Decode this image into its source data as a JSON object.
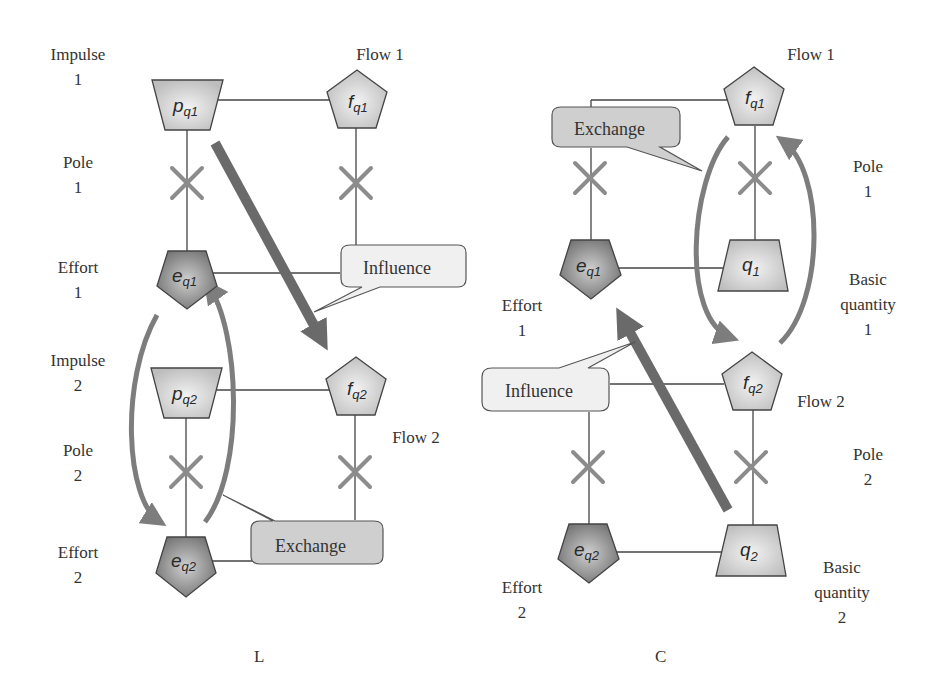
{
  "panels": [
    {
      "id": "L",
      "caption": "L",
      "labels": {
        "impulse1": "Impulse\n1",
        "pole1": "Pole\n1",
        "effort1": "Effort\n1",
        "impulse2": "Impulse\n2",
        "pole2": "Pole\n2",
        "effort2": "Effort\n2",
        "flow1": "Flow 1",
        "flow2": "Flow 2"
      },
      "nodes": {
        "p1": {
          "base": "p",
          "sub": "q1",
          "shape": "inverted-trapezoid"
        },
        "f1": {
          "base": "f",
          "sub": "q1",
          "shape": "pentagon"
        },
        "e1": {
          "base": "e",
          "sub": "q1",
          "shape": "inverted-pentagon"
        },
        "p2": {
          "base": "p",
          "sub": "q2",
          "shape": "inverted-trapezoid"
        },
        "f2": {
          "base": "f",
          "sub": "q2",
          "shape": "pentagon"
        },
        "e2": {
          "base": "e",
          "sub": "q2",
          "shape": "inverted-pentagon"
        }
      },
      "callouts": {
        "influence": "Influence",
        "exchange": "Exchange"
      }
    },
    {
      "id": "C",
      "caption": "C",
      "labels": {
        "flow1": "Flow 1",
        "pole1": "Pole\n1",
        "basic1": "Basic\nquantity\n1",
        "effort1": "Effort\n1",
        "flow2": "Flow 2",
        "pole2": "Pole\n2",
        "basic2": "Basic\nquantity\n2",
        "effort2": "Effort\n2"
      },
      "nodes": {
        "f1": {
          "base": "f",
          "sub": "q1",
          "shape": "pentagon"
        },
        "q1": {
          "base": "q",
          "sub": "1",
          "shape": "trapezoid"
        },
        "e1": {
          "base": "e",
          "sub": "q1",
          "shape": "inverted-pentagon"
        },
        "f2": {
          "base": "f",
          "sub": "q2",
          "shape": "pentagon"
        },
        "q2": {
          "base": "q",
          "sub": "2",
          "shape": "trapezoid"
        },
        "e2": {
          "base": "e",
          "sub": "q2",
          "shape": "inverted-pentagon"
        }
      },
      "callouts": {
        "exchange": "Exchange",
        "influence": "Influence"
      }
    }
  ],
  "colors": {
    "light_fill": "#d4d4d4",
    "dark_fill": "#8a8a8a",
    "arrow": "#7a7a7a",
    "line": "#444444",
    "cross": "#8c8c8c",
    "callout_light": "#f0f0f0",
    "callout_mid": "#cfcfcf"
  }
}
